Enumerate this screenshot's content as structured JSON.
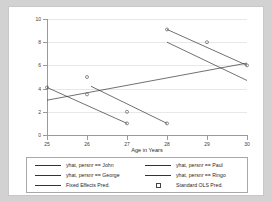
{
  "chart_data": {
    "type": "scatter",
    "title": "",
    "xlabel": "Age in Years",
    "ylabel": "",
    "xlim": [
      25,
      30
    ],
    "ylim": [
      0,
      10
    ],
    "xticks": [
      "25",
      "26",
      "27",
      "28",
      "29",
      "30"
    ],
    "yticks": [
      "0",
      "2",
      "4",
      "6",
      "8",
      "10"
    ],
    "grid": true,
    "legend_position": "bottom",
    "series": [
      {
        "name": "yhat, persnr == John",
        "type": "line",
        "x": [
          25,
          27
        ],
        "values": [
          4.1,
          1.0
        ]
      },
      {
        "name": "yhat, persnr == Paul",
        "type": "line",
        "x": [
          28,
          30
        ],
        "values": [
          8.0,
          4.7
        ]
      },
      {
        "name": "yhat, persnr == George",
        "type": "line",
        "x": [
          26.1,
          28
        ],
        "values": [
          4.2,
          1.0
        ]
      },
      {
        "name": "yhat, persnr == Ringo",
        "type": "line",
        "x": [
          28,
          30
        ],
        "values": [
          9.1,
          6.0
        ]
      },
      {
        "name": "Fixed Effects Pred.",
        "type": "line",
        "x": [
          25,
          30
        ],
        "values": [
          3.0,
          6.2
        ]
      },
      {
        "name": "Standard OLS Pred.",
        "type": "scatter",
        "x": [
          25,
          26,
          26,
          27,
          27,
          28,
          28,
          29,
          30
        ],
        "values": [
          4.1,
          5.0,
          3.5,
          2.0,
          1.0,
          9.1,
          1.0,
          8.0,
          6.0
        ]
      }
    ]
  },
  "legend": {
    "entries": [
      {
        "label": "yhat, persnr == John",
        "marker": "line"
      },
      {
        "label": "yhat, persnr == Paul",
        "marker": "line"
      },
      {
        "label": "yhat, persnr == George",
        "marker": "line"
      },
      {
        "label": "yhat, persnr == Ringo",
        "marker": "line"
      },
      {
        "label": "Fixed Effects Pred.",
        "marker": "line"
      },
      {
        "label": "Standard OLS Pred.",
        "marker": "square"
      }
    ]
  },
  "colors": {
    "page_background": "#d2d2d2",
    "card_background": "#ffffff",
    "plot_background": "#ffffff",
    "gridline": "#e8e8e8",
    "axis": "#9a9a9a",
    "line": "#333333",
    "marker_edge": "#444444",
    "text": "#2a2a2a"
  }
}
